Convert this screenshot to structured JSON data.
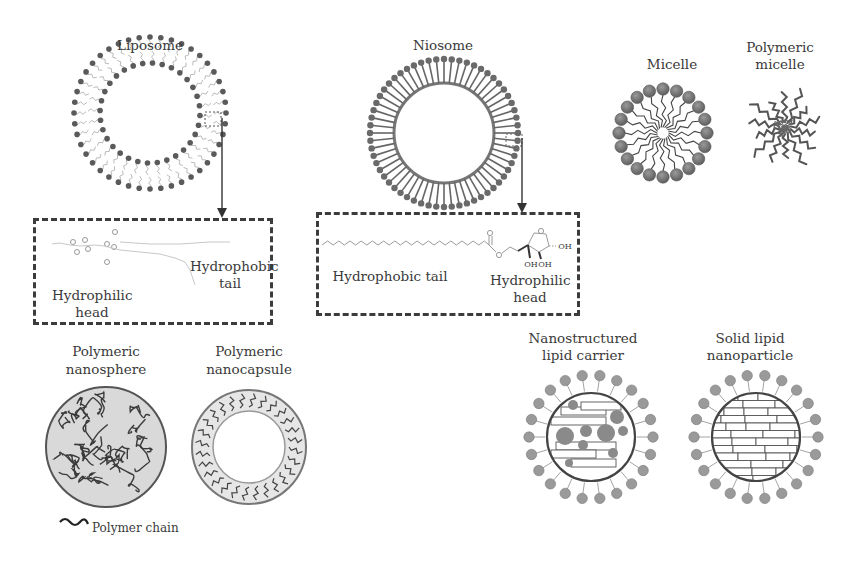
{
  "figure": {
    "liposome": {
      "label": "Liposome",
      "inset": {
        "hydrophobic_label_1": "Hydrophobic",
        "hydrophobic_label_2": "tail",
        "hydrophilic_label_1": "Hydrophilic",
        "hydrophilic_label_2": "head"
      }
    },
    "niosome": {
      "label": "Niosome",
      "inset": {
        "hydrophobic_label": "Hydrophobic tail",
        "hydrophilic_label_1": "Hydrophilic",
        "hydrophilic_label_2": "head",
        "oh_labels": [
          "OH",
          "OH",
          "OH"
        ],
        "o_labels": [
          "O",
          "O",
          "O"
        ]
      }
    },
    "micelle": {
      "label": "Micelle"
    },
    "polymeric_micelle": {
      "label_1": "Polymeric",
      "label_2": "micelle"
    },
    "polymeric_nanosphere": {
      "label_1": "Polymeric",
      "label_2": "nanosphere"
    },
    "polymeric_nanocapsule": {
      "label_1": "Polymeric",
      "label_2": "nanocapsule"
    },
    "legend": {
      "polymer_chain": "Polymer chain"
    },
    "nlc": {
      "label_1": "Nanostructured",
      "label_2": "lipid carrier"
    },
    "sln": {
      "label_1": "Solid lipid",
      "label_2": "nanoparticle"
    }
  },
  "colors": {
    "lipid_head": "#6b6b6b",
    "line": "#3c3c3c",
    "fill_light": "#d8d8d8"
  }
}
